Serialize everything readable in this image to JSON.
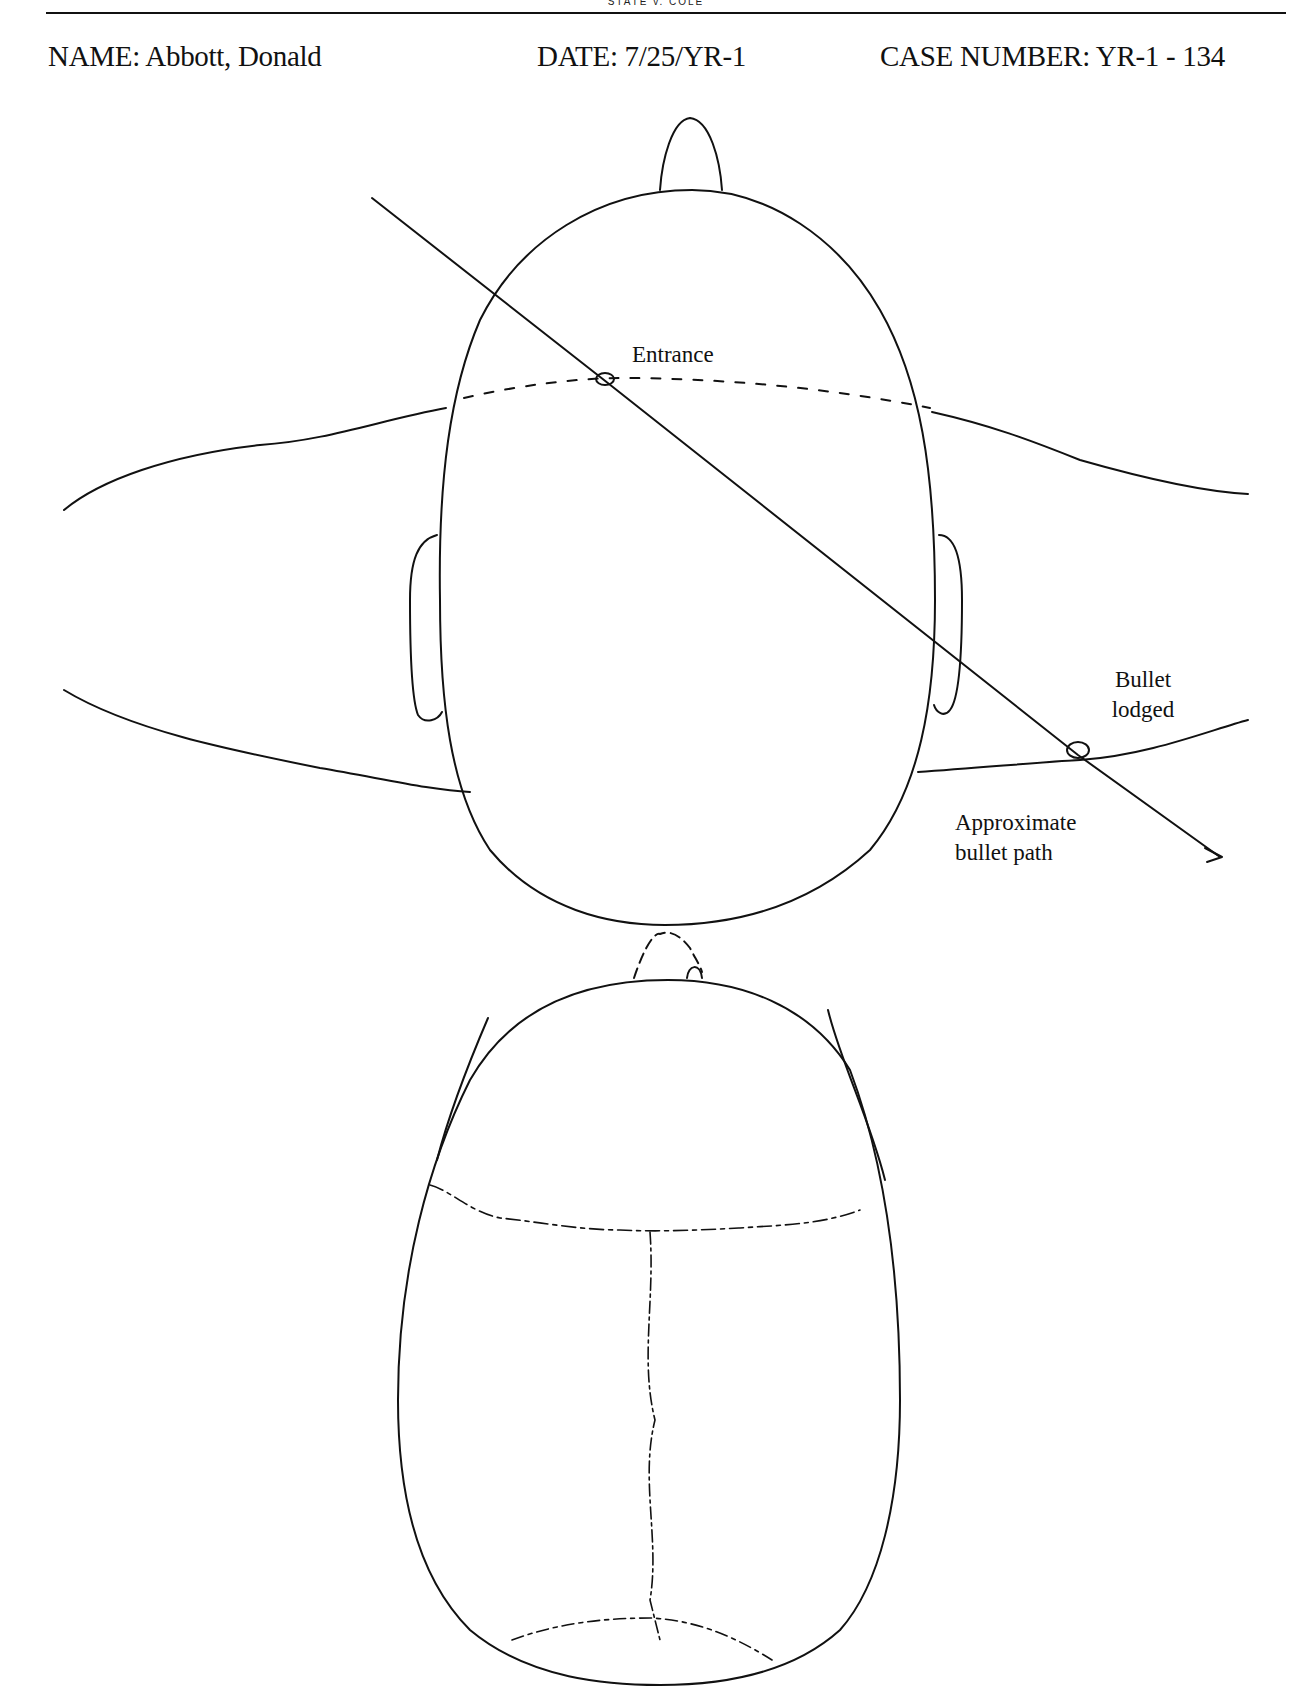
{
  "running_head": "STATE v. COLE",
  "header": {
    "name_label": "NAME: Abbott, Donald",
    "date_label": "DATE: 7/25/YR-1",
    "case_label": "CASE NUMBER: YR-1 - 134"
  },
  "diagram": {
    "top_view": {
      "entrance_label": "Entrance",
      "bullet_lodged_label_line1": "Bullet",
      "bullet_lodged_label_line2": "lodged",
      "path_label_line1": "Approximate",
      "path_label_line2": "bullet path"
    },
    "skull_view": {}
  }
}
